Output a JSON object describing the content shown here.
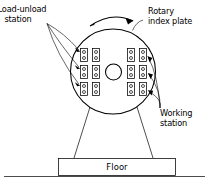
{
  "diagram": {
    "type": "technical-line-drawing",
    "background_color": "#ffffff",
    "line_color": "#000000"
  },
  "labels": {
    "load_unload": {
      "line1": "Load-unload",
      "line2": "station"
    },
    "rotary_index": {
      "line1": "Rotary",
      "line2": "index plate"
    },
    "working": {
      "line1": "Working",
      "line2": "station"
    },
    "floor": "Floor"
  },
  "geometry": {
    "plate": {
      "cx": 113,
      "cy": 71.5,
      "r": 42.5
    },
    "hub": {
      "cx": 113.5,
      "cy": 72,
      "r": 8.0
    },
    "rotation_arrow": {
      "direction": "clockwise",
      "path": "M 92 24 Q 113 12 135 22"
    },
    "pedestal": {
      "top_left_x": 90,
      "top_right_x": 137,
      "top_y": 108,
      "bottom_left_x": 74,
      "bottom_right_x": 153,
      "bottom_y": 158
    },
    "floor_box": {
      "x": 58,
      "y": 158,
      "width": 117,
      "height": 17
    },
    "ground_line": {
      "x1": 4,
      "y1": 176,
      "x2": 205,
      "y2": 176
    }
  },
  "stations": {
    "module_width": 7.0,
    "module_height": 13.0,
    "inner_circle_radius": 1.5,
    "rows_y": [
      55,
      72,
      89
    ],
    "left_columns_x": [
      84,
      96
    ],
    "right_columns_x": [
      131,
      143
    ],
    "left_group_name": "load-unload-stations",
    "right_group_name": "working-stations",
    "count_total": 12
  },
  "leaders": {
    "load_unload_origin": {
      "x": 47,
      "y": 23
    },
    "load_unload_targets": [
      {
        "x": 80,
        "y": 53
      },
      {
        "x": 80,
        "y": 70
      },
      {
        "x": 80,
        "y": 87
      }
    ],
    "working_origin": {
      "x": 160,
      "y": 110
    },
    "working_targets": [
      {
        "x": 148,
        "y": 58
      },
      {
        "x": 150,
        "y": 75
      },
      {
        "x": 150,
        "y": 92
      }
    ],
    "rotary_origin": {
      "x": 142,
      "y": 22
    },
    "rotary_target": {
      "x": 133,
      "y": 30
    }
  }
}
